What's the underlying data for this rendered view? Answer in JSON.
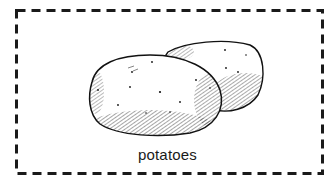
{
  "card": {
    "caption": "potatoes",
    "image_subject": "potato-illustration",
    "border_style": "dashed",
    "border_color": "#1a1a1a",
    "background": "#ffffff"
  }
}
